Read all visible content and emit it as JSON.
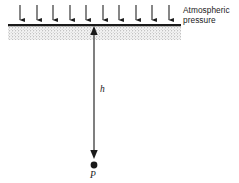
{
  "figure": {
    "type": "physics-diagram",
    "background_color": "#ffffff",
    "ink_color": "#1a1a1a",
    "canvas": {
      "width": 239,
      "height": 183
    }
  },
  "labels": {
    "atmospheric_line1": "Atmospheric",
    "atmospheric_line2": "pressure",
    "depth": "h",
    "point": "P"
  },
  "surface": {
    "name": "fluid-surface-line",
    "x_start": 8,
    "x_end": 181,
    "y": 25,
    "thickness": 2.2,
    "color": "#1a1a1a"
  },
  "fluid_region": {
    "name": "stippled-fluid-body",
    "x_start": 8,
    "x_end": 181,
    "y_top": 27,
    "y_bottom": 40,
    "fill": "#f2f2f2",
    "stipple_color": "#9a9a9a"
  },
  "pressure_arrows": {
    "count": 10,
    "direction": "down",
    "y_top": 5,
    "y_tip": 24,
    "color": "#1a1a1a",
    "x_positions": [
      20,
      37,
      53,
      70,
      86,
      103,
      119,
      136,
      152,
      169
    ]
  },
  "depth_arrow": {
    "name": "depth-dimension-arrow",
    "x": 94,
    "y_top": 26,
    "y_bottom": 159,
    "direction": "both",
    "color": "#1a1a1a"
  },
  "point_marker": {
    "name": "point-p-marker",
    "cx": 94,
    "cy": 165,
    "r": 3.4,
    "color": "#1a1a1a"
  }
}
